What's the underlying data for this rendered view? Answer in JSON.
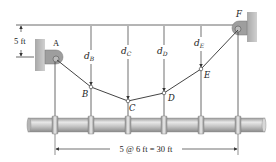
{
  "diagram": {
    "type": "cable-supported pipe",
    "points": {
      "A": {
        "label": "A",
        "x": 57,
        "y": 60
      },
      "B": {
        "label": "B",
        "x": 91,
        "y": 87
      },
      "C": {
        "label": "C",
        "x": 128,
        "y": 101
      },
      "D": {
        "label": "D",
        "x": 164,
        "y": 93
      },
      "E": {
        "label": "E",
        "x": 201,
        "y": 69
      },
      "F": {
        "label": "F",
        "x": 238,
        "y": 28
      }
    },
    "sag_labels": {
      "dB": {
        "main": "d",
        "sub": "B"
      },
      "dC": {
        "main": "d",
        "sub": "C"
      },
      "dD": {
        "main": "d",
        "sub": "D"
      },
      "dE": {
        "main": "d",
        "sub": "E"
      }
    },
    "vertical_offset_label": "5 ft",
    "span_label": "5 @ 6 ft = 30 ft",
    "colors": {
      "line": "#333333",
      "pipe_light": "#e6e6e6",
      "pipe_mid": "#bdbdbd",
      "pipe_dark": "#8a8a8a",
      "wall": "#b8b8b8",
      "pulley": "#9a9a9a"
    }
  }
}
